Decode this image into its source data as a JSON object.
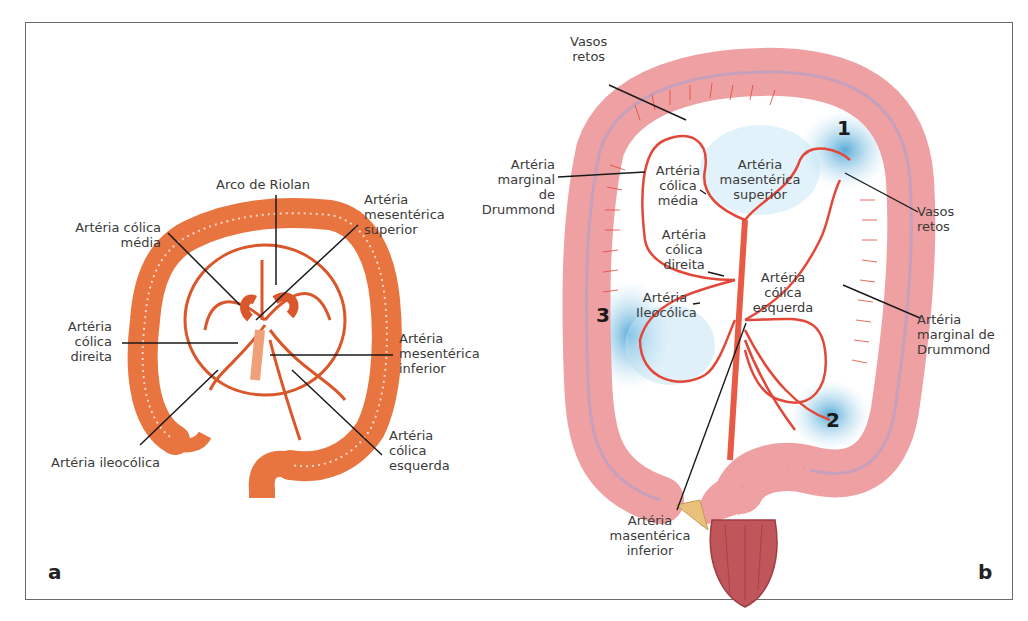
{
  "figure": {
    "panel_a": {
      "letter": "a",
      "labels": {
        "arco_riolan": "Arco de Riolan",
        "colica_media": "Artéria cólica\nmédia",
        "mesenterica_superior": "Artéria\nmesentérica\nsuperior",
        "colica_direita": "Artéria\ncólica\ndireita",
        "mesenterica_inferior": "Artéria\nmesentérica\ninferior",
        "ileocolica": "Artéria ileocólica",
        "colica_esquerda": "Artéria\ncólica\nesquerda"
      }
    },
    "panel_b": {
      "letter": "b",
      "labels": {
        "vasos_retos_top": "Vasos\nretos",
        "marginal_drummond_left": "Artéria\nmarginal de\nDrummond",
        "colica_media": "Artéria\ncólica\nmédia",
        "masenterica_superior": "Artéria\nmasentérica\nsuperior",
        "vasos_retos_right": "Vasos\nretos",
        "colica_direita": "Artéria\ncólica\ndireita",
        "ileocolica": "Artéria\nIleocólica",
        "colica_esquerda": "Artéria\ncólica\nesquerda",
        "marginal_drummond_right": "Artéria\nmarginal de\nDrummond",
        "masenterica_inferior": "Artéria\nmasentérica\ninferior"
      },
      "zones": [
        "1",
        "2",
        "3"
      ]
    },
    "colors": {
      "panel_a_colon": "#e8743f",
      "panel_a_vessel": "#d9572a",
      "panel_b_colon": "#eea0a3",
      "panel_b_vessel": "#e2483a",
      "watershed": "#6fb8dd",
      "rectum": "#c0555a"
    }
  }
}
